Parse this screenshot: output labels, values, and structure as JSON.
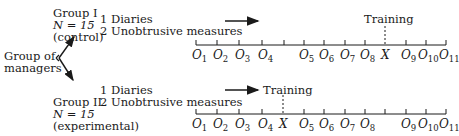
{
  "source_group": {
    "line1": "Group of",
    "line2": "managers"
  },
  "groups": [
    {
      "name": "Group I",
      "n": "N = 15",
      "type": "(control)",
      "measures": [
        "1 Diaries",
        "2 Unobtrusive measures"
      ],
      "training_label": "Training",
      "timeline": [
        "O1",
        "O2",
        "O3",
        "O4",
        "",
        "O5",
        "O6",
        "O7",
        "O8",
        "X",
        "O9",
        "O10",
        "O11"
      ]
    },
    {
      "name": "Group II",
      "n": "N = 15",
      "type": "(experimental)",
      "measures": [
        "1 Diaries",
        "2 Unobtrusive measures"
      ],
      "training_label": "Training",
      "timeline": [
        "O1",
        "O2",
        "O3",
        "O4",
        "X",
        "O5",
        "O6",
        "O7",
        "O8",
        "",
        "O9",
        "O10",
        "O11"
      ]
    }
  ],
  "labels": {
    "g1": {
      "o1": "O",
      "s1": "1",
      "o2": "O",
      "s2": "2",
      "o3": "O",
      "s3": "3",
      "o4": "O",
      "s4": "4",
      "o5": "O",
      "s5": "5",
      "o6": "O",
      "s6": "6",
      "o7": "O",
      "s7": "7",
      "o8": "O",
      "s8": "8",
      "x": "X",
      "o9": "O",
      "s9": "9",
      "o10": "O",
      "s10": "10",
      "o11": "O",
      "s11": "11"
    },
    "g2": {
      "o1": "O",
      "s1": "1",
      "o2": "O",
      "s2": "2",
      "o3": "O",
      "s3": "3",
      "o4": "O",
      "s4": "4",
      "x": "X",
      "o5": "O",
      "s5": "5",
      "o6": "O",
      "s6": "6",
      "o7": "O",
      "s7": "7",
      "o8": "O",
      "s8": "8",
      "o9": "O",
      "s9": "9",
      "o10": "O",
      "s10": "10",
      "o11": "O",
      "s11": "11"
    }
  }
}
